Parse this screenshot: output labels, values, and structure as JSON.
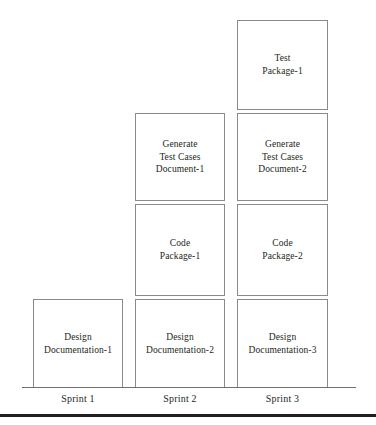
{
  "figure": {
    "type": "stacked-column-diagram",
    "baseline_axis": true,
    "bottom_rule": true,
    "border_color": "#8a8a8a",
    "text_color": "#231f20",
    "rule_color": "#231f20"
  },
  "chart_data": {
    "type": "bar",
    "title": "",
    "xlabel": "",
    "ylabel": "",
    "categories": [
      "Sprint 1",
      "Sprint 2",
      "Sprint 3"
    ],
    "stacked": true,
    "series": [
      {
        "name": "Design Documentation",
        "values": [
          1,
          1,
          1
        ],
        "labels": [
          "Design\nDocumentation-1",
          "Design\nDocumentation-2",
          "Design\nDocumentation-3"
        ]
      },
      {
        "name": "Code Package",
        "values": [
          0,
          1,
          1
        ],
        "labels": [
          null,
          "Code\nPackage-1",
          "Code\nPackage-2"
        ]
      },
      {
        "name": "Generate Test Cases Document",
        "values": [
          0,
          1,
          1
        ],
        "labels": [
          null,
          "Generate\nTest Cases\nDocument-1",
          "Generate\nTest Cases\nDocument-2"
        ]
      },
      {
        "name": "Test Package",
        "values": [
          0,
          0,
          1
        ],
        "labels": [
          null,
          null,
          "Test\nPackage-1"
        ]
      }
    ],
    "totals": [
      1,
      3,
      4
    ],
    "legend": null,
    "grid": false
  },
  "columns": [
    {
      "category": "Sprint 1",
      "blocks": [
        {
          "line1": "Design",
          "line2": "Documentation-1",
          "line3": ""
        }
      ]
    },
    {
      "category": "Sprint 2",
      "blocks": [
        {
          "line1": "Generate",
          "line2": "Test Cases",
          "line3": "Document-1"
        },
        {
          "line1": "Code",
          "line2": "Package-1",
          "line3": ""
        },
        {
          "line1": "Design",
          "line2": "Documentation-2",
          "line3": ""
        }
      ]
    },
    {
      "category": "Sprint 3",
      "blocks": [
        {
          "line1": "Test",
          "line2": "Package-1",
          "line3": ""
        },
        {
          "line1": "Generate",
          "line2": "Test Cases",
          "line3": "Document-2"
        },
        {
          "line1": "Code",
          "line2": "Package-2",
          "line3": ""
        },
        {
          "line1": "Design",
          "line2": "Documentation-3",
          "line3": ""
        }
      ]
    }
  ]
}
